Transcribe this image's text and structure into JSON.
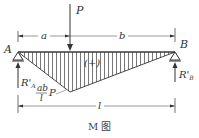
{
  "figure": {
    "caption": "M 图",
    "load_label": "P",
    "support_left_label": "A",
    "support_right_label": "B",
    "reaction_left_label": "R'",
    "reaction_left_sub": "A",
    "reaction_right_label": "R'",
    "reaction_right_sub": "B",
    "dim_a": "a",
    "dim_b": "b",
    "dim_l": "l",
    "moment_sign": "(+)",
    "peak_value_num": "ab",
    "peak_value_den": "l",
    "peak_value_factor": "P",
    "colors": {
      "line": "#333333",
      "hatch": "#555555",
      "background": "#ffffff"
    }
  }
}
